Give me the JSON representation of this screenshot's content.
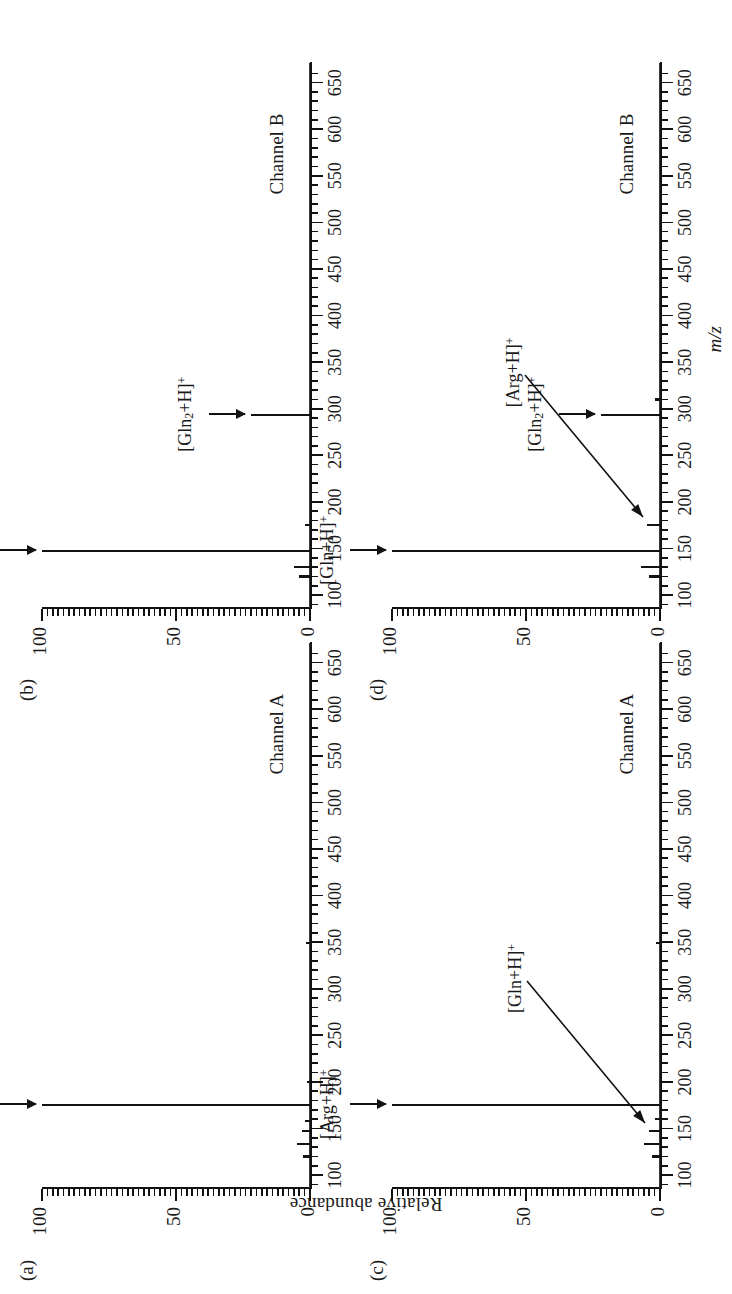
{
  "figure": {
    "ylabel": "Relative abundance",
    "xlabel": "m/z",
    "panels": [
      {
        "letter": "(a)",
        "channel": "Channel A",
        "annotations": [
          {
            "kind": "arrow",
            "label_pre": "[Arg+H]",
            "label_sub": "",
            "label_post": "",
            "sup": "+",
            "mz": 175,
            "y": 100
          }
        ],
        "peaks": [
          {
            "mz": 175,
            "intensity": 100
          },
          {
            "mz": 147,
            "intensity": 3
          },
          {
            "mz": 133,
            "intensity": 5
          },
          {
            "mz": 120,
            "intensity": 2.5
          },
          {
            "mz": 158,
            "intensity": 2
          },
          {
            "mz": 349,
            "intensity": 1.5
          },
          {
            "mz": 200,
            "intensity": 1
          }
        ]
      },
      {
        "letter": "(b)",
        "channel": "Channel B",
        "annotations": [
          {
            "kind": "arrow",
            "label_pre": "[Gln+H]",
            "label_sub": "",
            "label_post": "",
            "sup": "+",
            "mz": 147,
            "y": 100
          },
          {
            "kind": "arrow",
            "label_pre": "[Gln",
            "label_sub": "2",
            "label_post": "+H]",
            "sup": "+",
            "mz": 293,
            "y": 22
          }
        ],
        "peaks": [
          {
            "mz": 147,
            "intensity": 100
          },
          {
            "mz": 293,
            "intensity": 22
          },
          {
            "mz": 130,
            "intensity": 6
          },
          {
            "mz": 120,
            "intensity": 4
          },
          {
            "mz": 175,
            "intensity": 2
          }
        ]
      },
      {
        "letter": "(c)",
        "channel": "Channel A",
        "annotations": [
          {
            "kind": "arrow",
            "label_pre": "[Arg+H]",
            "label_sub": "",
            "label_post": "",
            "sup": "+",
            "mz": 175,
            "y": 100
          },
          {
            "kind": "diag",
            "label_pre": "[Gln+H]",
            "label_sub": "",
            "label_post": "",
            "sup": "+",
            "mz": 147,
            "y": 4
          }
        ],
        "peaks": [
          {
            "mz": 175,
            "intensity": 100
          },
          {
            "mz": 147,
            "intensity": 4
          },
          {
            "mz": 133,
            "intensity": 6
          },
          {
            "mz": 120,
            "intensity": 3
          },
          {
            "mz": 160,
            "intensity": 2
          },
          {
            "mz": 349,
            "intensity": 1.5
          }
        ]
      },
      {
        "letter": "(d)",
        "channel": "Channel B",
        "annotations": [
          {
            "kind": "arrow",
            "label_pre": "[Gln+H]",
            "label_sub": "",
            "label_post": "",
            "sup": "+",
            "mz": 147,
            "y": 100
          },
          {
            "kind": "arrow",
            "label_pre": "[Gln",
            "label_sub": "2",
            "label_post": "+H]",
            "sup": "+",
            "mz": 293,
            "y": 22
          },
          {
            "kind": "diag",
            "label_pre": "[Arg+H]",
            "label_sub": "",
            "label_post": "",
            "sup": "+",
            "mz": 175,
            "y": 5
          }
        ],
        "peaks": [
          {
            "mz": 147,
            "intensity": 100
          },
          {
            "mz": 293,
            "intensity": 22
          },
          {
            "mz": 175,
            "intensity": 5
          },
          {
            "mz": 130,
            "intensity": 7
          },
          {
            "mz": 120,
            "intensity": 4
          },
          {
            "mz": 310,
            "intensity": 2
          }
        ]
      }
    ]
  },
  "chart_data": {
    "type": "line",
    "title": "",
    "xlabel": "m/z",
    "ylabel": "Relative abundance",
    "xlim": [
      85,
      670
    ],
    "ylim": [
      0,
      100
    ],
    "xticks": [
      100,
      150,
      200,
      250,
      300,
      350,
      400,
      450,
      500,
      550,
      600,
      650
    ],
    "xtick_labels": [
      "100",
      "150",
      "200",
      "250",
      "300",
      "350",
      "400",
      "450",
      "500",
      "550",
      "600",
      "650"
    ],
    "yticks": [
      0,
      50,
      100
    ],
    "ytick_labels": [
      "0",
      "50",
      "100"
    ],
    "grid": false,
    "legend": "none",
    "panels": [
      {
        "id": "a",
        "label": "(a)",
        "subtitle": "Channel A",
        "annotations": [
          "[Arg+H]+"
        ],
        "x": [
          120,
          133,
          147,
          158,
          175,
          200,
          349
        ],
        "y": [
          2.5,
          5,
          3,
          2,
          100,
          1,
          1.5
        ]
      },
      {
        "id": "b",
        "label": "(b)",
        "subtitle": "Channel B",
        "annotations": [
          "[Gln+H]+",
          "[Gln2+H]+"
        ],
        "x": [
          120,
          130,
          147,
          175,
          293
        ],
        "y": [
          4,
          6,
          100,
          2,
          22
        ]
      },
      {
        "id": "c",
        "label": "(c)",
        "subtitle": "Channel A",
        "annotations": [
          "[Arg+H]+",
          "[Gln+H]+"
        ],
        "x": [
          120,
          133,
          147,
          160,
          175,
          349
        ],
        "y": [
          3,
          6,
          4,
          2,
          100,
          1.5
        ]
      },
      {
        "id": "d",
        "label": "(d)",
        "subtitle": "Channel B",
        "annotations": [
          "[Gln+H]+",
          "[Gln2+H]+",
          "[Arg+H]+"
        ],
        "x": [
          120,
          130,
          147,
          175,
          293,
          310
        ],
        "y": [
          4,
          7,
          100,
          5,
          22,
          2
        ]
      }
    ]
  }
}
